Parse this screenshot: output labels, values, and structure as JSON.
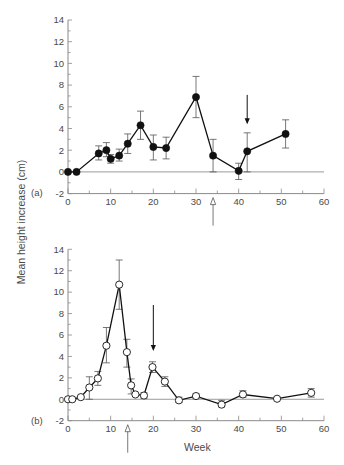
{
  "chart_data": {
    "type": "line",
    "ylabel": "Mean height increase (cm)",
    "xlabel": "Week",
    "xlim": [
      0,
      60
    ],
    "ylim": [
      -2,
      14
    ],
    "x_ticks": [
      0,
      10,
      20,
      30,
      40,
      50,
      60
    ],
    "y_ticks": [
      -2,
      0,
      2,
      4,
      6,
      8,
      10,
      12,
      14
    ],
    "grid": false,
    "reference_line_y": 0,
    "colors": {
      "series": "#111111",
      "axis": "#8a8a8a",
      "text": "#4a4a4a",
      "ref_line": "#9a9a9a"
    },
    "panels": [
      {
        "label": "(a)",
        "marker": "filled-circle",
        "points": [
          {
            "x": 0,
            "y": 0
          },
          {
            "x": 2,
            "y": 0
          },
          {
            "x": 7.2,
            "y": 1.7,
            "lo": 1.1,
            "hi": 2.4
          },
          {
            "x": 9,
            "y": 2.0,
            "lo": 1.4,
            "hi": 2.7
          },
          {
            "x": 10,
            "y": 1.2,
            "lo": 0.8,
            "hi": 1.6
          },
          {
            "x": 12,
            "y": 1.5,
            "lo": 1.0,
            "hi": 2.1
          },
          {
            "x": 14,
            "y": 2.6,
            "lo": 1.7,
            "hi": 3.5
          },
          {
            "x": 17,
            "y": 4.3,
            "lo": 3.0,
            "hi": 5.6
          },
          {
            "x": 20,
            "y": 2.3,
            "lo": 1.1,
            "hi": 3.4
          },
          {
            "x": 23,
            "y": 2.2,
            "lo": 1.2,
            "hi": 3.2
          },
          {
            "x": 30,
            "y": 6.9,
            "lo": 5.0,
            "hi": 8.8
          },
          {
            "x": 34,
            "y": 1.5,
            "lo": 0.0,
            "hi": 3.0
          },
          {
            "x": 40,
            "y": 0.1,
            "lo": -0.7,
            "hi": 0.8
          },
          {
            "x": 42,
            "y": 1.9,
            "lo": 0.0,
            "hi": 3.6
          },
          {
            "x": 51,
            "y": 3.5,
            "lo": 2.2,
            "hi": 4.8
          }
        ],
        "annotations": [
          {
            "type": "solid-arrow-down",
            "x": 42,
            "y_from": 7.1,
            "y_to": 4.4
          },
          {
            "type": "open-arrow-up-below-axis",
            "x": 34
          }
        ]
      },
      {
        "label": "(b)",
        "marker": "open-circle",
        "points": [
          {
            "x": 0,
            "y": 0
          },
          {
            "x": 1,
            "y": 0
          },
          {
            "x": 3,
            "y": 0.2
          },
          {
            "x": 5,
            "y": 1.1,
            "lo": 0.0,
            "hi": 2.1
          },
          {
            "x": 7,
            "y": 1.95,
            "lo": 1.3,
            "hi": 2.6
          },
          {
            "x": 9,
            "y": 5.0,
            "lo": 3.4,
            "hi": 6.7
          },
          {
            "x": 12,
            "y": 10.7,
            "lo": 8.4,
            "hi": 13.0
          },
          {
            "x": 13.8,
            "y": 4.4,
            "lo": 3.0,
            "hi": 5.6
          },
          {
            "x": 14.8,
            "y": 1.3,
            "lo": 0.5,
            "hi": 1.9
          },
          {
            "x": 15.8,
            "y": 0.45
          },
          {
            "x": 17.8,
            "y": 0.35,
            "lo": 0.1,
            "hi": 0.6
          },
          {
            "x": 19.8,
            "y": 3.0,
            "lo": 2.5,
            "hi": 3.5
          },
          {
            "x": 22.7,
            "y": 1.65,
            "lo": 1.2,
            "hi": 2.1
          },
          {
            "x": 26,
            "y": -0.1,
            "lo": -0.3,
            "hi": 0.2
          },
          {
            "x": 30,
            "y": 0.3,
            "lo": 0.1,
            "hi": 0.5
          },
          {
            "x": 36,
            "y": -0.5,
            "lo": -0.7,
            "hi": -0.1
          },
          {
            "x": 41,
            "y": 0.45,
            "lo": 0.2,
            "hi": 0.8
          },
          {
            "x": 49,
            "y": 0.05
          },
          {
            "x": 57,
            "y": 0.6,
            "lo": 0.2,
            "hi": 1.0
          }
        ],
        "annotations": [
          {
            "type": "solid-arrow-down",
            "x": 20,
            "y_from": 8.8,
            "y_to": 4.5
          },
          {
            "type": "open-arrow-up-below-axis",
            "x": 14
          }
        ]
      }
    ]
  }
}
